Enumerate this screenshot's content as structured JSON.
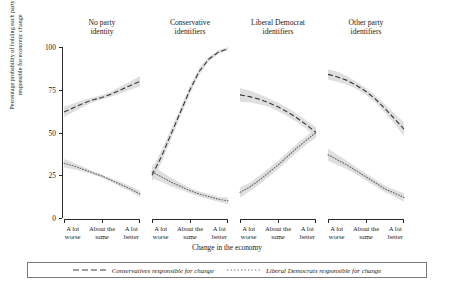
{
  "chart_data": {
    "type": "line",
    "title": "",
    "xlabel": "Change in the economy",
    "ylabel_line1": "Percentage probability of holding each party",
    "ylabel_line2": "responsible for economic change",
    "categories": [
      "A lot worse",
      "About the same",
      "A lot better"
    ],
    "category_lines": [
      [
        "A lot",
        "worse"
      ],
      [
        "About the",
        "same"
      ],
      [
        "A lot",
        "better"
      ]
    ],
    "ylim": [
      0,
      100
    ],
    "yticks": [
      0,
      25,
      50,
      75,
      100
    ],
    "xlim": [
      0,
      2
    ],
    "grid": false,
    "legend_position": "bottom",
    "facet_layout": "1x4",
    "series_styles": [
      {
        "name": "Conservatives responsible for change",
        "dash": "dashed",
        "color": "#3c3c3c"
      },
      {
        "name": "Liberal Democrats responsible for change",
        "dash": "dotted",
        "color": "#6e6e6e"
      }
    ],
    "ribbon_color": "#d9d9d9",
    "panels": [
      {
        "title_line1": "No party",
        "title_line2": "identity",
        "series": [
          {
            "name": "Conservatives responsible for change",
            "x": [
              0,
              0.25,
              0.5,
              0.75,
              1,
              1.25,
              1.5,
              1.75,
              2
            ],
            "values": [
              62,
              64.5,
              67,
              69,
              70.5,
              72.5,
              75,
              77.5,
              80
            ],
            "ci_low": [
              59,
              62,
              65,
              67.5,
              69.5,
              71,
              73,
              75,
              77
            ],
            "ci_high": [
              65,
              67,
              69,
              70.5,
              72,
              74,
              77,
              80,
              83
            ]
          },
          {
            "name": "Liberal Democrats responsible for change",
            "x": [
              0,
              0.25,
              0.5,
              0.75,
              1,
              1.25,
              1.5,
              1.75,
              2
            ],
            "values": [
              32,
              30.5,
              28.5,
              26.5,
              24.5,
              22,
              19.5,
              17,
              14
            ],
            "ci_low": [
              29.5,
              28.5,
              27,
              25.5,
              23.5,
              21,
              18,
              15.5,
              12
            ],
            "ci_high": [
              34.5,
              32.5,
              30,
              27.5,
              25.5,
              23,
              21,
              18.5,
              16
            ]
          }
        ]
      },
      {
        "title_line1": "Conservative",
        "title_line2": "identifiers",
        "series": [
          {
            "name": "Conservatives responsible for change",
            "x": [
              0,
              0.25,
              0.5,
              0.75,
              1,
              1.25,
              1.5,
              1.75,
              2
            ],
            "values": [
              25,
              36,
              49,
              62,
              75,
              86,
              93,
              97,
              99
            ],
            "ci_low": [
              21,
              32.5,
              46,
              59.5,
              72.5,
              84,
              91.5,
              96,
              98
            ],
            "ci_high": [
              29,
              39.5,
              52,
              64.5,
              77.5,
              88,
              94.5,
              98,
              100
            ]
          },
          {
            "name": "Liberal Democrats responsible for change",
            "x": [
              0,
              0.25,
              0.5,
              0.75,
              1,
              1.25,
              1.5,
              1.75,
              2
            ],
            "values": [
              27,
              24,
              21,
              18.5,
              16,
              14,
              12.5,
              11,
              10
            ],
            "ci_low": [
              23,
              21,
              18.5,
              16.5,
              14.5,
              12.5,
              11,
              9.5,
              8
            ],
            "ci_high": [
              31,
              27,
              23.5,
              20.5,
              17.5,
              15.5,
              14,
              12.5,
              12
            ]
          }
        ]
      },
      {
        "title_line1": "Liberal Democrat",
        "title_line2": "identifiers",
        "series": [
          {
            "name": "Conservatives responsible for change",
            "x": [
              0,
              0.25,
              0.5,
              0.75,
              1,
              1.25,
              1.5,
              1.75,
              2
            ],
            "values": [
              72,
              71,
              69.5,
              67.5,
              65,
              62,
              58.5,
              54.5,
              50
            ],
            "ci_low": [
              68,
              67.5,
              66.5,
              65,
              62.5,
              59.5,
              56,
              52,
              47
            ],
            "ci_high": [
              76,
              74.5,
              72.5,
              70,
              67.5,
              64.5,
              61,
              57,
              53
            ]
          },
          {
            "name": "Liberal Democrats responsible for change",
            "x": [
              0,
              0.25,
              0.5,
              0.75,
              1,
              1.25,
              1.5,
              1.75,
              2
            ],
            "values": [
              15,
              18,
              22,
              26.5,
              31,
              36,
              41,
              45.5,
              50
            ],
            "ci_low": [
              12,
              15.5,
              19.5,
              24,
              28.5,
              33.5,
              38.5,
              43,
              47
            ],
            "ci_high": [
              18,
              20.5,
              24.5,
              29,
              33.5,
              38.5,
              43.5,
              48,
              53
            ]
          }
        ]
      },
      {
        "title_line1": "Other party",
        "title_line2": "identifiers",
        "series": [
          {
            "name": "Conservatives responsible for change",
            "x": [
              0,
              0.25,
              0.5,
              0.75,
              1,
              1.25,
              1.5,
              1.75,
              2
            ],
            "values": [
              84,
              82.5,
              80.5,
              77.5,
              74,
              69.5,
              64,
              58,
              52
            ],
            "ci_low": [
              81,
              79.5,
              78,
              75.5,
              72,
              67.5,
              61.5,
              55,
              48
            ],
            "ci_high": [
              87,
              85.5,
              83,
              79.5,
              76,
              71.5,
              66.5,
              61,
              56
            ]
          },
          {
            "name": "Liberal Democrats responsible for change",
            "x": [
              0,
              0.25,
              0.5,
              0.75,
              1,
              1.25,
              1.5,
              1.75,
              2
            ],
            "values": [
              37,
              34,
              31,
              27.5,
              24,
              20.5,
              17,
              14.5,
              12
            ],
            "ci_low": [
              33.5,
              31,
              28.5,
              25.5,
              22,
              18.5,
              15,
              12.5,
              9.5
            ],
            "ci_high": [
              40.5,
              37,
              33.5,
              29.5,
              26,
              22.5,
              19,
              16.5,
              14.5
            ]
          }
        ]
      }
    ]
  },
  "legend": {
    "items": [
      {
        "label": "Conservatives responsible for change",
        "style": "dashed"
      },
      {
        "label": "Liberal Democrats responsible for change",
        "style": "dotted"
      }
    ]
  }
}
